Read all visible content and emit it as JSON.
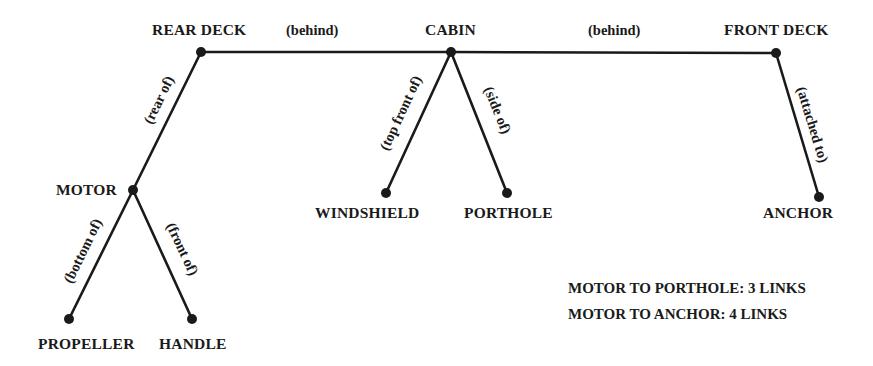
{
  "diagram": {
    "type": "semantic-network",
    "colors": {
      "ink": "#1a1a1a",
      "background": "#ffffff"
    },
    "nodes": [
      {
        "id": "rear_deck",
        "label": "REAR DECK",
        "x": 201,
        "y": 52
      },
      {
        "id": "cabin",
        "label": "CABIN",
        "x": 451,
        "y": 52
      },
      {
        "id": "front_deck",
        "label": "FRONT DECK",
        "x": 776,
        "y": 53
      },
      {
        "id": "motor",
        "label": "MOTOR",
        "x": 133,
        "y": 190
      },
      {
        "id": "windshield",
        "label": "WINDSHIELD",
        "x": 386,
        "y": 193
      },
      {
        "id": "porthole",
        "label": "PORTHOLE",
        "x": 507,
        "y": 193
      },
      {
        "id": "anchor",
        "label": "ANCHOR",
        "x": 819,
        "y": 197
      },
      {
        "id": "propeller",
        "label": "PROPELLER",
        "x": 69,
        "y": 319
      },
      {
        "id": "handle",
        "label": "HANDLE",
        "x": 192,
        "y": 319
      }
    ],
    "edges": [
      {
        "from": "rear_deck",
        "to": "cabin",
        "label": "(behind)"
      },
      {
        "from": "cabin",
        "to": "front_deck",
        "label": "(behind)"
      },
      {
        "from": "rear_deck",
        "to": "motor",
        "label": "(rear of)"
      },
      {
        "from": "cabin",
        "to": "windshield",
        "label": "(top front of)"
      },
      {
        "from": "cabin",
        "to": "porthole",
        "label": "(side of)"
      },
      {
        "from": "front_deck",
        "to": "anchor",
        "label": "(attached to)"
      },
      {
        "from": "motor",
        "to": "propeller",
        "label": "(bottom of)"
      },
      {
        "from": "motor",
        "to": "handle",
        "label": "(front of)"
      }
    ],
    "notes": [
      "MOTOR TO PORTHOLE: 3 LINKS",
      "MOTOR TO ANCHOR: 4 LINKS"
    ]
  }
}
